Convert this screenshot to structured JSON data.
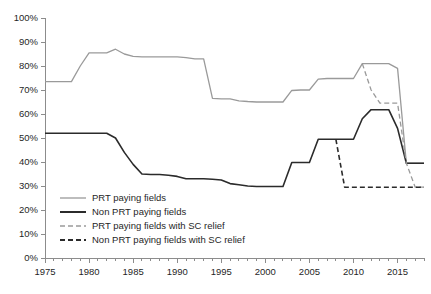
{
  "chart_data": {
    "type": "line",
    "title": "",
    "xlabel": "",
    "ylabel": "",
    "xlim": [
      1975,
      2018
    ],
    "ylim": [
      0,
      100
    ],
    "grid": false,
    "legend_position": "inside-lower-left",
    "y_ticks": [
      "0%",
      "10%",
      "20%",
      "30%",
      "40%",
      "50%",
      "60%",
      "70%",
      "80%",
      "90%",
      "100%"
    ],
    "y_tick_values": [
      0,
      10,
      20,
      30,
      40,
      50,
      60,
      70,
      80,
      90,
      100
    ],
    "x_ticks": [
      "1975",
      "1980",
      "1985",
      "1990",
      "1995",
      "2000",
      "2005",
      "2010",
      "2015"
    ],
    "x_tick_values": [
      1975,
      1980,
      1985,
      1990,
      1995,
      2000,
      2005,
      2010,
      2015
    ],
    "x_minor_step": 1,
    "series": [
      {
        "name": "PRT paying fields",
        "color": "#9a9a9a",
        "style": "solid",
        "width": 1.3,
        "x": [
          1975,
          1976,
          1977,
          1978,
          1979,
          1980,
          1981,
          1982,
          1983,
          1984,
          1985,
          1986,
          1987,
          1988,
          1989,
          1990,
          1991,
          1992,
          1993,
          1994,
          1995,
          1996,
          1997,
          1998,
          1999,
          2000,
          2001,
          2002,
          2003,
          2004,
          2005,
          2006,
          2007,
          2008,
          2009,
          2010,
          2011,
          2012,
          2013,
          2014,
          2015,
          2016,
          2017,
          2018
        ],
        "values": [
          73.5,
          73.5,
          73.5,
          73.5,
          80.0,
          85.5,
          85.5,
          85.5,
          87.0,
          85.0,
          84.0,
          83.8,
          83.8,
          83.8,
          83.8,
          83.8,
          83.5,
          83.0,
          83.0,
          66.5,
          66.3,
          66.3,
          65.5,
          65.2,
          65.0,
          65.0,
          65.0,
          65.0,
          69.8,
          70.0,
          70.0,
          74.5,
          74.8,
          74.8,
          74.8,
          74.8,
          81.0,
          81.0,
          81.0,
          81.0,
          79.0,
          39.5,
          39.5,
          39.5
        ]
      },
      {
        "name": "Non PRT paying fields",
        "color": "#2b2b2b",
        "style": "solid",
        "width": 1.6,
        "x": [
          1975,
          1976,
          1977,
          1978,
          1979,
          1980,
          1981,
          1982,
          1983,
          1984,
          1985,
          1986,
          1987,
          1988,
          1989,
          1990,
          1991,
          1992,
          1993,
          1994,
          1995,
          1996,
          1997,
          1998,
          1999,
          2000,
          2001,
          2002,
          2003,
          2004,
          2005,
          2006,
          2007,
          2008,
          2009,
          2010,
          2011,
          2012,
          2013,
          2014,
          2015,
          2016,
          2017,
          2018
        ],
        "values": [
          52.0,
          52.0,
          52.0,
          52.0,
          52.0,
          52.0,
          52.0,
          52.0,
          50.0,
          44.0,
          39.0,
          35.0,
          34.8,
          34.8,
          34.5,
          34.0,
          33.0,
          33.0,
          33.0,
          32.8,
          32.5,
          31.0,
          30.5,
          30.0,
          29.8,
          29.8,
          29.8,
          29.8,
          39.8,
          39.8,
          39.8,
          49.5,
          49.5,
          49.5,
          49.5,
          49.5,
          58.0,
          61.8,
          61.8,
          61.8,
          54.0,
          39.5,
          39.5,
          39.5
        ]
      },
      {
        "name": "PRT paying fields with SC relief",
        "color": "#9a9a9a",
        "style": "dashed",
        "width": 1.3,
        "dash": "5,3",
        "x": [
          2011,
          2012,
          2013,
          2014,
          2015,
          2016,
          2017,
          2018
        ],
        "values": [
          81.0,
          70.0,
          64.5,
          64.5,
          64.5,
          39.5,
          29.5,
          29.5
        ]
      },
      {
        "name": "Non PRT paying fields with SC relief",
        "color": "#2b2b2b",
        "style": "dashed",
        "width": 1.6,
        "dash": "5,3",
        "x": [
          2008,
          2009,
          2010,
          2011,
          2012,
          2013,
          2014,
          2015,
          2016,
          2017,
          2018
        ],
        "values": [
          49.5,
          29.5,
          29.5,
          29.5,
          29.5,
          29.5,
          29.5,
          29.5,
          29.5,
          29.5,
          29.5
        ]
      }
    ]
  },
  "legend": {
    "items": [
      {
        "label": "PRT paying fields",
        "color": "#9a9a9a",
        "style": "solid",
        "width": 1.3
      },
      {
        "label": "Non PRT paying fields",
        "color": "#2b2b2b",
        "style": "solid",
        "width": 2.0
      },
      {
        "label": "PRT paying fields with SC relief",
        "color": "#9a9a9a",
        "style": "dashed",
        "width": 1.3,
        "dash": "5,3"
      },
      {
        "label": "Non PRT paying fields with SC relief",
        "color": "#2b2b2b",
        "style": "dashed",
        "width": 2.0,
        "dash": "5,3"
      }
    ]
  },
  "layout": {
    "plot_left": 45,
    "plot_right": 424,
    "plot_top": 18,
    "plot_bottom": 258,
    "legend_x": 60,
    "legend_text_x": 92,
    "legend_y_start": 198,
    "legend_row_height": 14
  }
}
